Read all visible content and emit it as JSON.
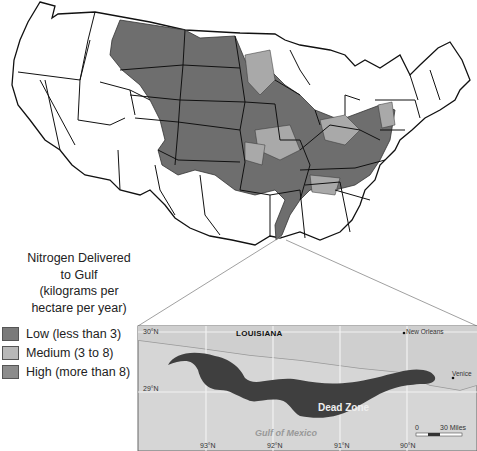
{
  "legend": {
    "title_lines": [
      "Nitrogen Delivered",
      "to Gulf",
      "(kilograms per",
      "hectare per year)"
    ],
    "items": [
      {
        "label": "Low (less than 3)",
        "color": "#7a7a7a"
      },
      {
        "label": "Medium (3 to 8)",
        "color": "#b8b8b8"
      },
      {
        "label": "High (more than 8)",
        "color": "#8c8c8c"
      }
    ]
  },
  "inset": {
    "state_label": "LOUISIANA",
    "cities": [
      "New Orleans",
      "Venice"
    ],
    "water_label": "Gulf of Mexico",
    "zone_label": "Dead Zone",
    "lat_labels": [
      "30°N",
      "29°N"
    ],
    "lon_labels": [
      "93°N",
      "92°N",
      "91°N",
      "90°N"
    ],
    "scale": {
      "start": "0",
      "end": "30 Miles"
    }
  },
  "colors": {
    "basin_dark": "#6e6e6e",
    "basin_medium": "#a9a9a9",
    "state_fill": "#ffffff",
    "inset_bg": "#d6d6d6",
    "dead_zone": "#3f3f3f"
  }
}
